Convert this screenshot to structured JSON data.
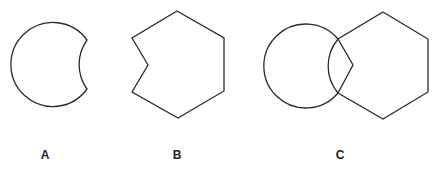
{
  "figure": {
    "stroke_color": "#2a2a2a",
    "background": "#ffffff",
    "panels": [
      {
        "id": "A",
        "label": "A",
        "shape": "circle with concave circular cut on the right side",
        "label_position": [
          45,
          159
        ]
      },
      {
        "id": "B",
        "label": "B",
        "shape": "hexagon with inward-pointing notch on the left side",
        "label_position": [
          177,
          159
        ]
      },
      {
        "id": "C",
        "label": "C",
        "shape": "circle overlapping notched hexagon",
        "label_position": [
          340,
          159
        ]
      }
    ]
  }
}
